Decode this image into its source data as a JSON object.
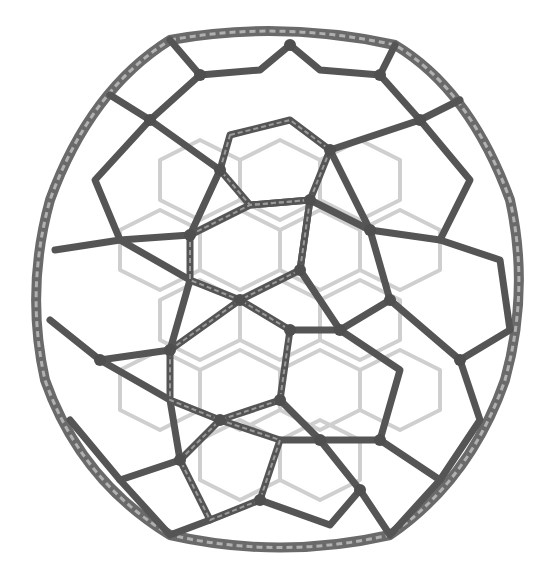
{
  "image": {
    "subject": "molecular cage structure rendered as grayscale tube lattice",
    "description": "Spherical/icosahedral cage of interlinked polypeptide-like strands forming hexagonal and pentagonal rings",
    "background_color": "#ffffff",
    "palette": {
      "front_dark": "#4a4a4a",
      "front_mid": "#6e6e6e",
      "back_light": "#bdbdbd",
      "back_faint": "#dcdcdc"
    },
    "cage": {
      "center_x": 280,
      "center_y": 290,
      "radius_x": 250,
      "radius_y": 260
    }
  }
}
